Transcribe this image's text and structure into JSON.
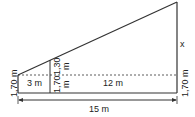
{
  "labels": {
    "left_height": "1,70 m",
    "inner_lower": "1,70",
    "inner_lower_unit": "m",
    "inner_upper": "1,30",
    "inner_upper_unit": "m",
    "short_base": "3 m",
    "long_base": "12 m",
    "right_height": "1,70 m",
    "unknown": "x",
    "total_base": "15 m"
  },
  "colors": {
    "line": "#333333",
    "text": "#222222"
  }
}
